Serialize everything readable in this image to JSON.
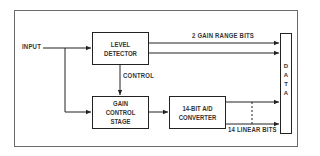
{
  "diagram": {
    "input_label": "INPUT",
    "control_label": "CONTROL",
    "gain_range_label": "2 GAIN RANGE BITS",
    "linear_bits_label": "14 LINEAR BITS",
    "blocks": {
      "level_detector": "LEVEL\nDETECTOR",
      "gain_control_stage": "GAIN\nCONTROL\nSTAGE",
      "ad_converter": "14-BIT  A/D\nCONVERTER"
    },
    "data_letters": [
      "D",
      "A",
      "T",
      "A"
    ],
    "colors": {
      "line": "#222222",
      "frame": "#6a6a6a",
      "text": "#333333",
      "background": "#ffffff"
    }
  }
}
